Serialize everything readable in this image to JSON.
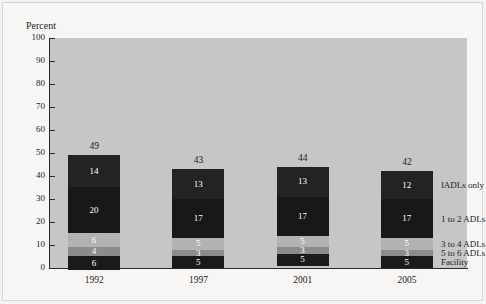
{
  "chart_data": {
    "type": "bar",
    "subtype": "stacked-column",
    "title": "",
    "xlabel": "",
    "ylabel": "Percent",
    "ylim": [
      0,
      100
    ],
    "yticks": [
      0,
      10,
      20,
      30,
      40,
      50,
      60,
      70,
      80,
      90,
      100
    ],
    "ytick_labels": [
      "0",
      "10",
      "20",
      "30",
      "40",
      "50",
      "60",
      "70",
      "80",
      "90",
      "100"
    ],
    "grid": false,
    "legend_position": "right-of-last-bar",
    "categories": [
      "1992",
      "1997",
      "2001",
      "2005"
    ],
    "series": [
      {
        "name": "Facility",
        "values": [
          6,
          5,
          5,
          5
        ],
        "color": "#1a1a1a",
        "label_color": "#ffffff"
      },
      {
        "name": "5 to 6 ADLs",
        "values": [
          4,
          3,
          3,
          3
        ],
        "color": "#8c8c8c",
        "label_color": "#ffffff"
      },
      {
        "name": "3 to 4 ADLs",
        "values": [
          6,
          5,
          5,
          5
        ],
        "color": "#b2b2b2",
        "label_color": "#ffffff"
      },
      {
        "name": "1 to 2 ADLs",
        "values": [
          20,
          17,
          17,
          17
        ],
        "color": "#181818",
        "label_color": "#ffffff"
      },
      {
        "name": "IADLs only",
        "values": [
          14,
          13,
          13,
          12
        ],
        "color": "#232323",
        "label_color": "#ffffff"
      }
    ],
    "totals": [
      49,
      43,
      44,
      42
    ],
    "total_labels": [
      "49",
      "43",
      "44",
      "42"
    ],
    "plot_background": "#c6c6c6",
    "page_background": "#f7f6f4",
    "axis_color": "#2a2a2a"
  }
}
